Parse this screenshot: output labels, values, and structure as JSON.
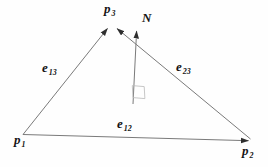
{
  "figure": {
    "colors": {
      "background": "#fefefe",
      "line": "#7a7a7a",
      "arrow": "#2e2e2e",
      "label": "#141414"
    },
    "labels": {
      "p1": {
        "base": "p",
        "sub": "1"
      },
      "p2": {
        "base": "p",
        "sub": "2"
      },
      "p3": {
        "base": "p",
        "sub": "3"
      },
      "e13": {
        "base": "e",
        "sub": "13"
      },
      "e23": {
        "base": "e",
        "sub": "23"
      },
      "e12": {
        "base": "e",
        "sub": "12"
      },
      "normal": {
        "base": "N",
        "sub": ""
      }
    }
  }
}
